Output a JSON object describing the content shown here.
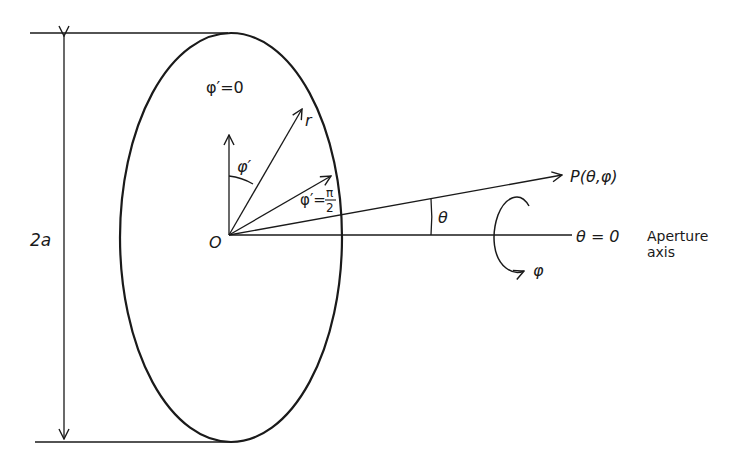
{
  "diagram": {
    "type": "circular-aperture-geometry",
    "labels": {
      "diameter": "2a",
      "origin": "O",
      "phi_prime_zero": "φ′=0",
      "phi_prime_angle": "φ′",
      "radius": "r",
      "phi_prime_half_pi_sym": "φ′=",
      "pi": "π",
      "two": "2",
      "observation_point": "P(θ,φ)",
      "theta_angle": "θ",
      "theta_zero": "θ = 0",
      "phi_rotation": "φ",
      "axis_label_line1": "Aperture",
      "axis_label_line2": "axis"
    },
    "colors": {
      "ink": "#1a1a1a",
      "background": "#ffffff"
    }
  }
}
